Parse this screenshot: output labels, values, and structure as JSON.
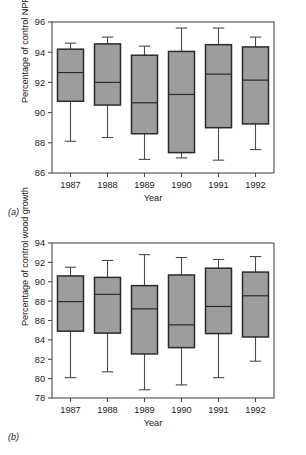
{
  "figure": {
    "panel_a_tag": "(a)",
    "panel_b_tag": "(b)"
  },
  "chart_data": [
    {
      "type": "box",
      "panel": "(a)",
      "title": "",
      "xlabel": "Year",
      "ylabel": "Percentage of control NPP",
      "categories": [
        "1987",
        "1988",
        "1989",
        "1990",
        "1991",
        "1992"
      ],
      "ylim": [
        86,
        96
      ],
      "yticks": [
        86,
        88,
        90,
        92,
        94,
        96
      ],
      "grid": false,
      "legend": "none",
      "box_fill": "#9d9d9d",
      "box_stroke": "#2b2b2b",
      "boxes": [
        {
          "category": "1987",
          "whisker_low": 88.1,
          "q1": 90.75,
          "median": 92.65,
          "q3": 94.2,
          "whisker_high": 94.6
        },
        {
          "category": "1988",
          "whisker_low": 88.35,
          "q1": 90.5,
          "median": 92.0,
          "q3": 94.55,
          "whisker_high": 95.0
        },
        {
          "category": "1989",
          "whisker_low": 86.9,
          "q1": 88.6,
          "median": 90.65,
          "q3": 93.8,
          "whisker_high": 94.4
        },
        {
          "category": "1990",
          "whisker_low": 87.0,
          "q1": 87.35,
          "median": 91.2,
          "q3": 94.05,
          "whisker_high": 95.6
        },
        {
          "category": "1991",
          "whisker_low": 86.85,
          "q1": 89.0,
          "median": 92.55,
          "q3": 94.5,
          "whisker_high": 95.6
        },
        {
          "category": "1992",
          "whisker_low": 87.55,
          "q1": 89.25,
          "median": 92.15,
          "q3": 94.35,
          "whisker_high": 95.0
        }
      ]
    },
    {
      "type": "box",
      "panel": "(b)",
      "title": "",
      "xlabel": "Year",
      "ylabel": "Percentage of control wood growth",
      "categories": [
        "1987",
        "1988",
        "1989",
        "1990",
        "1991",
        "1992"
      ],
      "ylim": [
        78,
        94
      ],
      "yticks": [
        78,
        80,
        82,
        84,
        86,
        88,
        90,
        92,
        94
      ],
      "grid": false,
      "legend": "none",
      "box_fill": "#9d9d9d",
      "box_stroke": "#2b2b2b",
      "boxes": [
        {
          "category": "1987",
          "whisker_low": 80.1,
          "q1": 84.9,
          "median": 87.95,
          "q3": 90.6,
          "whisker_high": 91.5
        },
        {
          "category": "1988",
          "whisker_low": 80.7,
          "q1": 84.7,
          "median": 88.7,
          "q3": 90.45,
          "whisker_high": 92.2
        },
        {
          "category": "1989",
          "whisker_low": 78.85,
          "q1": 82.55,
          "median": 87.2,
          "q3": 89.6,
          "whisker_high": 92.8
        },
        {
          "category": "1990",
          "whisker_low": 79.35,
          "q1": 83.2,
          "median": 85.55,
          "q3": 90.7,
          "whisker_high": 92.5
        },
        {
          "category": "1991",
          "whisker_low": 80.1,
          "q1": 84.65,
          "median": 87.45,
          "q3": 91.4,
          "whisker_high": 92.3
        },
        {
          "category": "1992",
          "whisker_low": 81.8,
          "q1": 84.3,
          "median": 88.55,
          "q3": 91.0,
          "whisker_high": 92.6
        }
      ]
    }
  ]
}
